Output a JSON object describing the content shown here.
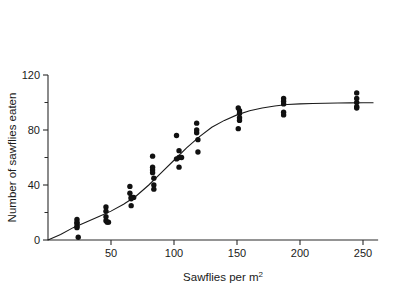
{
  "chart_data": {
    "type": "scatter",
    "title": "",
    "xlabel": "Sawflies per m2",
    "xlabel_base": "Sawflies per m",
    "xlabel_exponent": "2",
    "ylabel": "Number of sawflies eaten",
    "xlim": [
      0,
      262
    ],
    "ylim": [
      0,
      120
    ],
    "grid": false,
    "legend": "none",
    "xticks": [
      50,
      100,
      150,
      200,
      250
    ],
    "xticklabels": [
      "50",
      "100",
      "150",
      "200",
      "250"
    ],
    "yticks": [
      0,
      40,
      80,
      120
    ],
    "yticklabels": [
      "0",
      "40",
      "80",
      "120"
    ],
    "yticks_minor": [
      20,
      60,
      100
    ],
    "marker": "filled-circle",
    "marker_color": "#111111",
    "curve_color": "#1a1a1a",
    "axis_color": "#2b2b2b",
    "points": [
      {
        "x": 23,
        "y": 15
      },
      {
        "x": 23,
        "y": 13
      },
      {
        "x": 23,
        "y": 12
      },
      {
        "x": 23,
        "y": 10
      },
      {
        "x": 23,
        "y": 9
      },
      {
        "x": 24,
        "y": 2
      },
      {
        "x": 46,
        "y": 24
      },
      {
        "x": 46,
        "y": 21
      },
      {
        "x": 46,
        "y": 17
      },
      {
        "x": 46,
        "y": 14
      },
      {
        "x": 47,
        "y": 13
      },
      {
        "x": 48,
        "y": 13
      },
      {
        "x": 65,
        "y": 39
      },
      {
        "x": 65,
        "y": 34
      },
      {
        "x": 66,
        "y": 31
      },
      {
        "x": 68,
        "y": 31
      },
      {
        "x": 66,
        "y": 30
      },
      {
        "x": 66,
        "y": 25
      },
      {
        "x": 83,
        "y": 61
      },
      {
        "x": 83,
        "y": 53
      },
      {
        "x": 83,
        "y": 51
      },
      {
        "x": 83,
        "y": 49
      },
      {
        "x": 84,
        "y": 45
      },
      {
        "x": 84,
        "y": 40
      },
      {
        "x": 84,
        "y": 37
      },
      {
        "x": 102,
        "y": 76
      },
      {
        "x": 104,
        "y": 65
      },
      {
        "x": 104,
        "y": 60
      },
      {
        "x": 106,
        "y": 60
      },
      {
        "x": 102,
        "y": 59
      },
      {
        "x": 104,
        "y": 53
      },
      {
        "x": 118,
        "y": 85
      },
      {
        "x": 118,
        "y": 80
      },
      {
        "x": 118,
        "y": 78
      },
      {
        "x": 119,
        "y": 73
      },
      {
        "x": 119,
        "y": 64
      },
      {
        "x": 151,
        "y": 96
      },
      {
        "x": 152,
        "y": 94
      },
      {
        "x": 152,
        "y": 92
      },
      {
        "x": 152,
        "y": 89
      },
      {
        "x": 152,
        "y": 87
      },
      {
        "x": 151,
        "y": 81
      },
      {
        "x": 187,
        "y": 103
      },
      {
        "x": 187,
        "y": 101
      },
      {
        "x": 187,
        "y": 99
      },
      {
        "x": 187,
        "y": 93
      },
      {
        "x": 187,
        "y": 91
      },
      {
        "x": 245,
        "y": 107
      },
      {
        "x": 245,
        "y": 103
      },
      {
        "x": 245,
        "y": 100
      },
      {
        "x": 245,
        "y": 97
      },
      {
        "x": 245,
        "y": 96
      }
    ],
    "fit_curve": {
      "description": "sigmoid functional response",
      "x": [
        0,
        10,
        20,
        30,
        40,
        50,
        60,
        70,
        80,
        90,
        100,
        110,
        120,
        130,
        140,
        150,
        160,
        170,
        180,
        190,
        200,
        210,
        220,
        230,
        240,
        250,
        258
      ],
      "y": [
        0,
        4,
        9,
        13,
        17,
        21,
        26,
        32,
        40,
        49,
        58,
        67,
        75,
        82,
        87,
        91,
        94,
        96,
        97.5,
        98.5,
        99,
        99.3,
        99.5,
        99.6,
        99.7,
        99.8,
        99.8
      ]
    }
  }
}
